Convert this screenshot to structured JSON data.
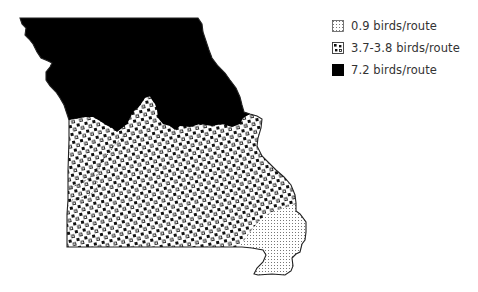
{
  "map": {
    "region": "Missouri",
    "colors": {
      "outline": "#222222",
      "high": "#000000",
      "background": "#ffffff"
    }
  },
  "legend": {
    "items": [
      {
        "label": "0.9 birds/route",
        "pattern": "fine-stipple"
      },
      {
        "label": "3.7-3.8 birds/route",
        "pattern": "dot-grid"
      },
      {
        "label": "7.2 birds/route",
        "pattern": "solid-black"
      }
    ]
  }
}
